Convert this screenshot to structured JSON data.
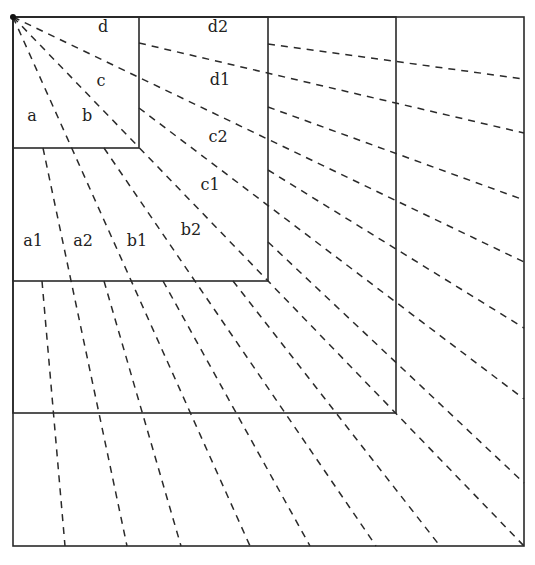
{
  "diagram": {
    "type": "nested-squares-with-radial-rays",
    "origin": {
      "x": 13,
      "y": 17
    },
    "squares": [
      {
        "name": "square-1",
        "x1": 13,
        "y1": 17,
        "x2": 139,
        "y2": 148
      },
      {
        "name": "square-2",
        "x1": 13,
        "y1": 17,
        "x2": 268,
        "y2": 281
      },
      {
        "name": "square-3",
        "x1": 13,
        "y1": 17,
        "x2": 396,
        "y2": 413
      },
      {
        "name": "square-4",
        "x1": 13,
        "y1": 17,
        "x2": 524,
        "y2": 546
      }
    ],
    "rays": [
      {
        "level": 1,
        "x1": 13,
        "y1": 17,
        "x2": 250,
        "y2": 546
      },
      {
        "level": 1,
        "x1": 13,
        "y1": 17,
        "x2": 524,
        "y2": 546
      },
      {
        "level": 1,
        "x1": 13,
        "y1": 17,
        "x2": 524,
        "y2": 262
      },
      {
        "level": 2,
        "x1": 43,
        "y1": 148,
        "x2": 127,
        "y2": 546
      },
      {
        "level": 2,
        "x1": 104,
        "y1": 148,
        "x2": 376,
        "y2": 546
      },
      {
        "level": 2,
        "x1": 139,
        "y1": 43,
        "x2": 524,
        "y2": 133
      },
      {
        "level": 2,
        "x1": 139,
        "y1": 108,
        "x2": 524,
        "y2": 399
      },
      {
        "level": 3,
        "x1": 42,
        "y1": 281,
        "x2": 65,
        "y2": 546
      },
      {
        "level": 3,
        "x1": 104,
        "y1": 281,
        "x2": 181,
        "y2": 546
      },
      {
        "level": 3,
        "x1": 163,
        "y1": 281,
        "x2": 310,
        "y2": 546
      },
      {
        "level": 3,
        "x1": 233,
        "y1": 281,
        "x2": 440,
        "y2": 546
      },
      {
        "level": 3,
        "x1": 268,
        "y1": 44,
        "x2": 524,
        "y2": 79
      },
      {
        "level": 3,
        "x1": 268,
        "y1": 107,
        "x2": 524,
        "y2": 200
      },
      {
        "level": 3,
        "x1": 268,
        "y1": 170,
        "x2": 524,
        "y2": 328
      },
      {
        "level": 3,
        "x1": 268,
        "y1": 242,
        "x2": 524,
        "y2": 483
      }
    ],
    "labels": [
      {
        "text": "d",
        "x": 103,
        "y": 32
      },
      {
        "text": "c",
        "x": 101,
        "y": 86
      },
      {
        "text": "a",
        "x": 32,
        "y": 121
      },
      {
        "text": "b",
        "x": 87,
        "y": 121
      },
      {
        "text": "d2",
        "x": 218,
        "y": 32
      },
      {
        "text": "d1",
        "x": 220,
        "y": 85
      },
      {
        "text": "c2",
        "x": 218,
        "y": 142
      },
      {
        "text": "c1",
        "x": 210,
        "y": 190
      },
      {
        "text": "b2",
        "x": 191,
        "y": 235
      },
      {
        "text": "a1",
        "x": 33,
        "y": 246
      },
      {
        "text": "a2",
        "x": 83,
        "y": 246
      },
      {
        "text": "b1",
        "x": 137,
        "y": 246
      }
    ]
  }
}
